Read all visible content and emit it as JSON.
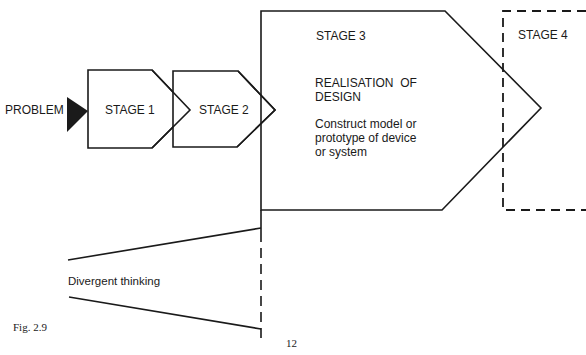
{
  "diagram": {
    "problem_label": "PROBLEM",
    "stages": [
      {
        "label": "STAGE 1"
      },
      {
        "label": "STAGE 2"
      },
      {
        "label": "STAGE 3",
        "title_line1": "REALISATION  OF",
        "title_line2": "DESIGN",
        "desc_line1": "Construct model or",
        "desc_line2": "prototype of device",
        "desc_line3": "or system"
      },
      {
        "label": "STAGE 4"
      }
    ],
    "divergent_label": "Divergent thinking",
    "figure_label": "Fig. 2.9",
    "page_number": "12",
    "colors": {
      "stroke": "#1a1a1a",
      "background": "#ffffff"
    }
  }
}
